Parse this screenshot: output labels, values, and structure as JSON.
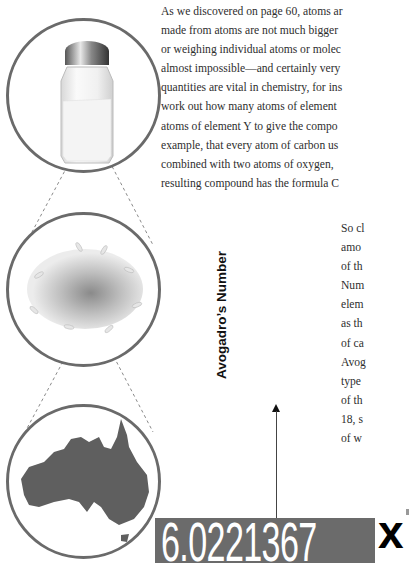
{
  "paragraph_1": {
    "lines": [
      "As we discovered on page 60, atoms ar",
      "made from atoms are not much bigger",
      "or weighing individual atoms or molec",
      "almost impossible—and certainly very",
      "quantities are vital in chemistry, for ins",
      "work out how many atoms of element",
      "atoms of element Y to give the compo",
      "example, that every atom of carbon us",
      "combined with two atoms of oxygen,",
      "resulting compound has the formula C"
    ]
  },
  "paragraph_2": {
    "lines": [
      "So cl",
      "amo",
      "of th",
      "Num",
      "elem",
      "as th",
      "of ca",
      "Avog",
      "type",
      "of th",
      "18, s",
      "of w"
    ]
  },
  "illustrations": {
    "salt_shaker": "salt-shaker-image",
    "rice_pile": "rice-pile-image",
    "australia_map": "australia-map-silhouette"
  },
  "vertical_label": "Avogadro’s Number",
  "number_value": "6.0221367",
  "times_symbol": "x",
  "colors": {
    "circle_stroke": "#6a6a6a",
    "number_box": "#6b6b6b",
    "map_fill": "#5f5f5f",
    "text": "#2e2e2e"
  }
}
